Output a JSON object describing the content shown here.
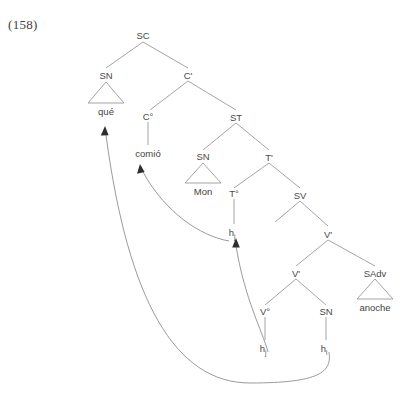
{
  "figure": {
    "example_number": "(158)",
    "language": "Spanish",
    "type": "syntax-tree",
    "sentence_words": [
      "qué",
      "comió",
      "Mon",
      "anoche"
    ]
  },
  "nodes": {
    "sc": "SC",
    "sn_spec": "SN",
    "c_bar": "C'",
    "c_head": "C°",
    "st": "ST",
    "sn_subject": "SN",
    "t_bar": "T'",
    "t_head": "T°",
    "sv": "SV",
    "v_bar_upper": "V'",
    "v_bar_lower": "V'",
    "v_head": "V°",
    "sn_object": "SN",
    "sadv": "SAdv"
  },
  "leaves": {
    "que": "qué",
    "comio": "comió",
    "mon": "Mon",
    "anoche": "anoche"
  },
  "traces": {
    "t_trace": {
      "base": "h",
      "subscript": "j"
    },
    "v_trace": {
      "base": "h",
      "subscript": "j"
    },
    "sn_trace": {
      "base": "h",
      "subscript": "i"
    }
  },
  "movements": [
    {
      "name": "head-movement-v-to-t",
      "from": "v_trace",
      "to": "t_trace"
    },
    {
      "name": "head-movement-t-to-c",
      "from": "t_trace",
      "to": "comio"
    },
    {
      "name": "wh-movement-sn-to-spec-sc",
      "from": "sn_trace",
      "to": "que"
    }
  ],
  "colors": {
    "line": "#9a9a9a",
    "text": "#4a4a4a",
    "arrow": "#2e2e2e",
    "background": "#ffffff"
  }
}
